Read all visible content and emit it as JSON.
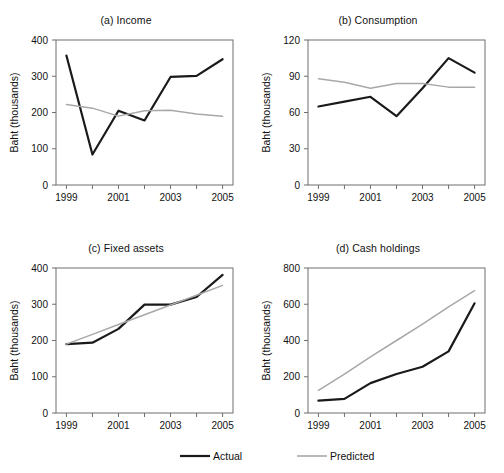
{
  "figure": {
    "title": "",
    "background": "#ffffff"
  },
  "legend": {
    "position": "bottom-center",
    "entries": [
      {
        "name": "Actual",
        "color": "#1a1a1a",
        "width": 2.2
      },
      {
        "name": "Predicted",
        "color": "#a8a8a8",
        "width": 1.6
      }
    ]
  },
  "chart_data": [
    {
      "type": "line",
      "panel": "a",
      "title": "(a) Income",
      "xlabel": "",
      "ylabel": "Baht (thousands)",
      "x": [
        1999,
        2000,
        2001,
        2002,
        2003,
        2004,
        2005
      ],
      "xtick_labels": [
        "1999",
        "",
        "2001",
        "",
        "2003",
        "",
        "2005"
      ],
      "xlim": [
        1998.6,
        2005.4
      ],
      "ylim": [
        0,
        400
      ],
      "yticks": [
        0,
        100,
        200,
        300,
        400
      ],
      "grid": false,
      "series": [
        {
          "name": "Actual",
          "color": "#1a1a1a",
          "values": [
            357,
            84,
            205,
            178,
            298,
            301,
            347
          ]
        },
        {
          "name": "Predicted",
          "color": "#a8a8a8",
          "values": [
            222,
            212,
            190,
            205,
            206,
            196,
            190
          ]
        }
      ]
    },
    {
      "type": "line",
      "panel": "b",
      "title": "(b) Consumption",
      "xlabel": "",
      "ylabel": "Baht (thousands)",
      "x": [
        1999,
        2000,
        2001,
        2002,
        2003,
        2004,
        2005
      ],
      "xtick_labels": [
        "1999",
        "",
        "2001",
        "",
        "2003",
        "",
        "2005"
      ],
      "xlim": [
        1998.6,
        2005.4
      ],
      "ylim": [
        0,
        120
      ],
      "yticks": [
        0,
        30,
        60,
        90,
        120
      ],
      "grid": false,
      "series": [
        {
          "name": "Actual",
          "color": "#1a1a1a",
          "values": [
            65,
            69,
            73,
            57,
            80,
            105,
            93
          ]
        },
        {
          "name": "Predicted",
          "color": "#a8a8a8",
          "values": [
            88,
            85,
            80,
            84,
            84,
            81,
            81
          ]
        }
      ]
    },
    {
      "type": "line",
      "panel": "c",
      "title": "(c) Fixed assets",
      "xlabel": "",
      "ylabel": "Baht (thousands)",
      "x": [
        1999,
        2000,
        2001,
        2002,
        2003,
        2004,
        2005
      ],
      "xtick_labels": [
        "1999",
        "",
        "2001",
        "",
        "2003",
        "",
        "2005"
      ],
      "xlim": [
        1998.6,
        2005.4
      ],
      "ylim": [
        0,
        400
      ],
      "yticks": [
        0,
        100,
        200,
        300,
        400
      ],
      "grid": false,
      "series": [
        {
          "name": "Actual",
          "color": "#1a1a1a",
          "values": [
            190,
            194,
            232,
            299,
            299,
            320,
            381
          ]
        },
        {
          "name": "Predicted",
          "color": "#a8a8a8",
          "values": [
            190,
            217,
            244,
            271,
            298,
            325,
            352
          ]
        }
      ]
    },
    {
      "type": "line",
      "panel": "d",
      "title": "(d) Cash holdings",
      "xlabel": "",
      "ylabel": "Baht (thousands)",
      "x": [
        1999,
        2000,
        2001,
        2002,
        2003,
        2004,
        2005
      ],
      "xtick_labels": [
        "1999",
        "",
        "2001",
        "",
        "2003",
        "",
        "2005"
      ],
      "xlim": [
        1998.6,
        2005.4
      ],
      "ylim": [
        0,
        800
      ],
      "yticks": [
        0,
        200,
        400,
        600,
        800
      ],
      "grid": false,
      "series": [
        {
          "name": "Actual",
          "color": "#1a1a1a",
          "values": [
            68,
            78,
            165,
            215,
            255,
            340,
            605
          ]
        },
        {
          "name": "Predicted",
          "color": "#a8a8a8",
          "values": [
            125,
            215,
            310,
            400,
            490,
            585,
            675
          ]
        }
      ]
    }
  ]
}
